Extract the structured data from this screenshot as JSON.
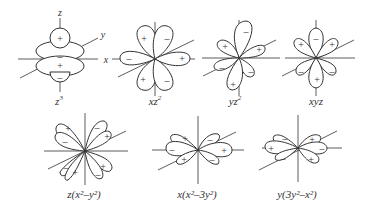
{
  "figure": {
    "axis_labels": {
      "z": "z",
      "y": "y",
      "x": "x",
      "x_dash": "–"
    },
    "orbitals": [
      {
        "id": "z3",
        "label_base": "z",
        "label_sup": "3",
        "signs": [
          "+",
          "–",
          "+",
          "–"
        ]
      },
      {
        "id": "xz2",
        "label_base": "xz",
        "label_sup": "2",
        "signs": [
          "+",
          "–",
          "–",
          "+",
          "+",
          "–"
        ]
      },
      {
        "id": "yz2",
        "label_base": "yz",
        "label_sup": "2",
        "signs": [
          "–",
          "+",
          "+",
          "–",
          "–",
          "+"
        ]
      },
      {
        "id": "xyz",
        "label_base": "xyz",
        "label_sup": "",
        "signs": [
          "–",
          "+",
          "+",
          "–",
          "+",
          "–"
        ]
      },
      {
        "id": "z_x2-y2",
        "label": "z(x²–y²)",
        "signs": [
          "+",
          "–",
          "–",
          "+",
          "–",
          "+",
          "+",
          "–"
        ]
      },
      {
        "id": "x_x2-3y2",
        "label": "x(x²–3y²)",
        "signs": [
          "+",
          "–",
          "–",
          "+",
          "+",
          "–"
        ]
      },
      {
        "id": "y_3y2-x2",
        "label": "y(3y²–x²)",
        "signs": [
          "–",
          "+",
          "+",
          "–",
          "–",
          "+"
        ]
      }
    ]
  }
}
